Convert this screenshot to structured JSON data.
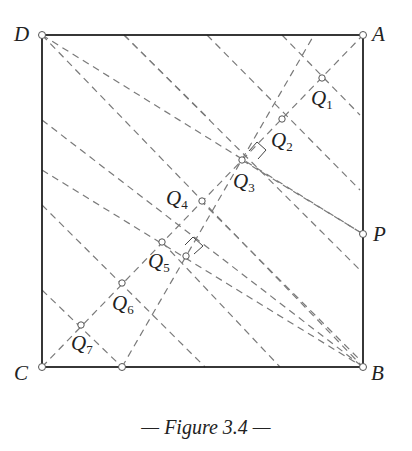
{
  "figure": {
    "caption": "— Figure 3.4 —",
    "square": {
      "D": {
        "label": "D",
        "x": 42,
        "y": 35
      },
      "A": {
        "label": "A",
        "x": 363,
        "y": 35
      },
      "B": {
        "label": "B",
        "x": 363,
        "y": 367
      },
      "C": {
        "label": "C",
        "x": 42,
        "y": 367
      }
    },
    "points": {
      "P": {
        "label": "P",
        "x": 363,
        "y": 234
      },
      "E": {
        "label": "",
        "x": 122,
        "y": 367
      }
    },
    "q_points": [
      {
        "label": "Q",
        "sub": "1",
        "x": 322,
        "y": 78
      },
      {
        "label": "Q",
        "sub": "2",
        "x": 282,
        "y": 119
      },
      {
        "label": "Q",
        "sub": "3",
        "x": 242,
        "y": 160
      },
      {
        "label": "Q",
        "sub": "4",
        "x": 202,
        "y": 201
      },
      {
        "label": "Q",
        "sub": "5",
        "x": 162,
        "y": 242
      },
      {
        "label": "Q",
        "sub": "6",
        "x": 122,
        "y": 283
      },
      {
        "label": "Q",
        "sub": "7",
        "x": 81,
        "y": 325
      }
    ],
    "colors": {
      "square_stroke": "#222222",
      "dash_stroke": "#777777",
      "point_fill": "#ffffff"
    }
  }
}
